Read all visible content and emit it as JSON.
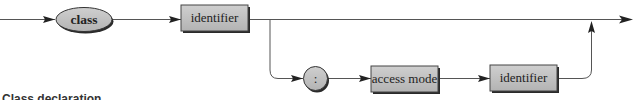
{
  "diagram": {
    "type": "syntax-railroad-diagram",
    "nodes": [
      {
        "id": "class",
        "label": "class",
        "shape": "ellipse",
        "kind": "keyword"
      },
      {
        "id": "identifier1",
        "label": "identifier",
        "shape": "box",
        "kind": "nonterminal"
      },
      {
        "id": "colon",
        "label": ":",
        "shape": "circle",
        "kind": "terminal"
      },
      {
        "id": "access_mode",
        "label": "access mode",
        "shape": "box",
        "kind": "nonterminal"
      },
      {
        "id": "identifier2",
        "label": "identifier",
        "shape": "box",
        "kind": "nonterminal"
      }
    ],
    "edges": [
      {
        "from": "start",
        "to": "class"
      },
      {
        "from": "class",
        "to": "identifier1"
      },
      {
        "from": "identifier1",
        "to": "end"
      },
      {
        "from": "identifier1",
        "to": "colon",
        "branch": "optional"
      },
      {
        "from": "colon",
        "to": "access_mode"
      },
      {
        "from": "access_mode",
        "to": "identifier2"
      },
      {
        "from": "identifier2",
        "to": "end",
        "rejoin": true
      }
    ],
    "caption": "Class declaration"
  },
  "colors": {
    "node_fill": "#bdbdbd",
    "node_shadow": "#2a2a2a",
    "line": "#555555",
    "arrow": "#222222"
  }
}
